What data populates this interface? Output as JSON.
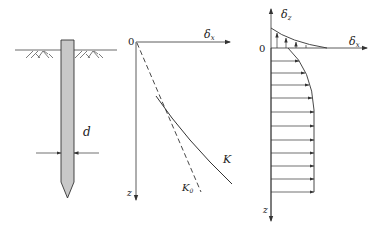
{
  "figure": {
    "pile_diagram": {
      "diameter_label": "d"
    },
    "displacement_plot": {
      "origin_label": "0",
      "x_axis_label": "δ",
      "x_axis_sub": "x",
      "z_axis_label": "z",
      "curve_labels": {
        "k": "K",
        "k0": "K",
        "k0_sub": "0"
      }
    },
    "distribution_plot": {
      "origin_label": "0",
      "vertical_axis_label": "δ",
      "vertical_axis_sub": "z",
      "horizontal_axis_label": "δ",
      "horizontal_axis_sub": "x",
      "z_axis_label": "z"
    }
  },
  "colors": {
    "line": "#333333",
    "pile_fill": "#c8c8c8"
  }
}
